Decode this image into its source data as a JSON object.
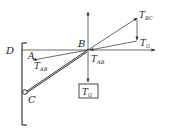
{
  "diagram": {
    "type": "force-diagram",
    "points": {
      "A": "A",
      "B": "B",
      "C": "C",
      "D": "D"
    },
    "forces": {
      "tension_bc": {
        "main": "T",
        "sub": "BC"
      },
      "gravity_triangle": {
        "main": "T",
        "sub": "G"
      },
      "tension_ab_left": {
        "main": "T",
        "sub": "AB"
      },
      "tension_ab_right": {
        "main": "T",
        "sub": "AB"
      },
      "gravity_box": {
        "main": "T",
        "sub": "G"
      }
    },
    "colors": {
      "line": "#333333",
      "text": "#222222",
      "background": "#ffffff"
    }
  }
}
